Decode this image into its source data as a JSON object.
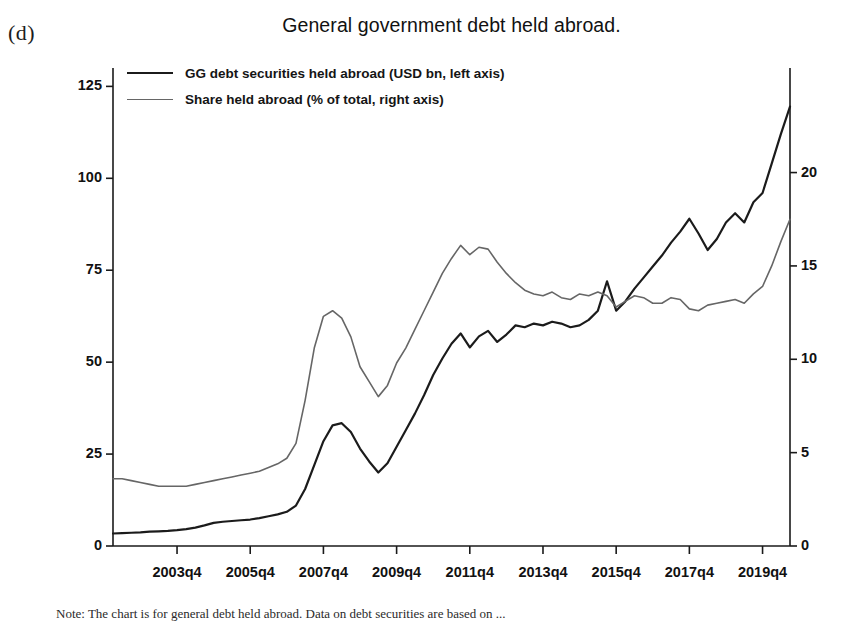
{
  "panel": {
    "label": "(d)"
  },
  "caption": {
    "text": "Note: The chart is for general debt held abroad. Data on debt securities are based on ..."
  },
  "legend": {
    "position": "top-left",
    "items": [
      {
        "label": "GG debt securities held abroad (USD bn, left axis)",
        "color": "#1b1b1b",
        "name": "gg-debt-securities"
      },
      {
        "label": "Share held abroad (% of total, right axis)",
        "color": "#666666",
        "name": "share-held-abroad"
      }
    ]
  },
  "chart_data": {
    "type": "line",
    "title": "General government debt held abroad.",
    "xlabel": "",
    "ylabel": "",
    "grid": false,
    "legend_position": "top-left",
    "x_tick_labels": [
      "2003q4",
      "2005q4",
      "2007q4",
      "2009q4",
      "2011q4",
      "2013q4",
      "2015q4",
      "2017q4",
      "2019q4"
    ],
    "x_range": [
      "2002q1",
      "2020q4"
    ],
    "left_axis": {
      "label": "USD bn",
      "ticks": [
        0,
        25,
        50,
        75,
        100,
        125
      ],
      "ylim": [
        0,
        130
      ]
    },
    "right_axis": {
      "label": "% of total",
      "ticks": [
        0,
        5,
        10,
        15,
        20
      ],
      "ylim": [
        0,
        25.6
      ]
    },
    "x": [
      "2002q1",
      "2002q2",
      "2002q3",
      "2002q4",
      "2003q1",
      "2003q2",
      "2003q3",
      "2003q4",
      "2004q1",
      "2004q2",
      "2004q3",
      "2004q4",
      "2005q1",
      "2005q2",
      "2005q3",
      "2005q4",
      "2006q1",
      "2006q2",
      "2006q3",
      "2006q4",
      "2007q1",
      "2007q2",
      "2007q3",
      "2007q4",
      "2008q1",
      "2008q2",
      "2008q3",
      "2008q4",
      "2009q1",
      "2009q2",
      "2009q3",
      "2009q4",
      "2010q1",
      "2010q2",
      "2010q3",
      "2010q4",
      "2011q1",
      "2011q2",
      "2011q3",
      "2011q4",
      "2012q1",
      "2012q2",
      "2012q3",
      "2012q4",
      "2013q1",
      "2013q2",
      "2013q3",
      "2013q4",
      "2014q1",
      "2014q2",
      "2014q3",
      "2014q4",
      "2015q1",
      "2015q2",
      "2015q3",
      "2015q4",
      "2016q1",
      "2016q2",
      "2016q3",
      "2016q4",
      "2017q1",
      "2017q2",
      "2017q3",
      "2017q4",
      "2018q1",
      "2018q2",
      "2018q3",
      "2018q4",
      "2019q1",
      "2019q2",
      "2019q3",
      "2019q4",
      "2020q1",
      "2020q2",
      "2020q3"
    ],
    "series": [
      {
        "name": "GG debt securities held abroad (USD bn, left axis)",
        "axis": "left",
        "color": "#1b1b1b",
        "width": 2.2,
        "values": [
          3.4,
          3.5,
          3.6,
          3.7,
          3.9,
          4.0,
          4.1,
          4.3,
          4.6,
          5.0,
          5.6,
          6.3,
          6.6,
          6.8,
          7.0,
          7.2,
          7.6,
          8.1,
          8.6,
          9.3,
          11.0,
          15.5,
          22.0,
          28.5,
          32.8,
          33.4,
          31.0,
          26.5,
          23.0,
          20.0,
          22.5,
          27.0,
          31.5,
          36.0,
          41.0,
          46.5,
          51.0,
          55.0,
          57.8,
          54.0,
          57.0,
          58.5,
          55.5,
          57.5,
          60.0,
          59.5,
          60.5,
          60.0,
          61.0,
          60.5,
          59.5,
          60.0,
          61.5,
          64.0,
          72.0,
          64.0,
          66.5,
          70.0,
          73.0,
          76.0,
          79.0,
          82.5,
          85.5,
          89.0,
          85.0,
          80.5,
          83.5,
          88.0,
          90.5,
          88.0,
          93.5,
          96.0,
          104.0,
          112.0,
          119.5
        ]
      },
      {
        "name": "Share held abroad (% of total, right axis)",
        "axis": "right",
        "color": "#666666",
        "width": 1.6,
        "values": [
          3.6,
          3.6,
          3.5,
          3.4,
          3.3,
          3.2,
          3.2,
          3.2,
          3.2,
          3.3,
          3.4,
          3.5,
          3.6,
          3.7,
          3.8,
          3.9,
          4.0,
          4.2,
          4.4,
          4.7,
          5.5,
          7.8,
          10.6,
          12.3,
          12.6,
          12.2,
          11.2,
          9.6,
          8.8,
          8.0,
          8.6,
          9.8,
          10.6,
          11.6,
          12.6,
          13.6,
          14.6,
          15.4,
          16.1,
          15.6,
          16.0,
          15.9,
          15.2,
          14.6,
          14.1,
          13.7,
          13.5,
          13.4,
          13.6,
          13.3,
          13.2,
          13.5,
          13.4,
          13.6,
          13.4,
          12.8,
          13.1,
          13.4,
          13.3,
          13.0,
          13.0,
          13.3,
          13.2,
          12.7,
          12.6,
          12.9,
          13.0,
          13.1,
          13.2,
          13.0,
          13.5,
          13.9,
          15.0,
          16.3,
          17.5
        ]
      }
    ]
  }
}
